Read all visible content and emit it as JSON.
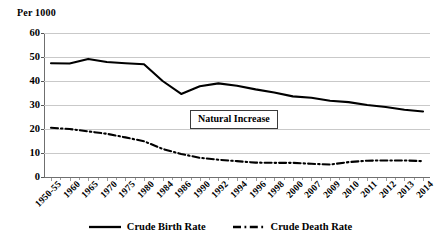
{
  "chart_data": {
    "type": "line",
    "title": "",
    "ylabel": "Per 1000",
    "xlabel": "",
    "ylim": [
      0,
      60
    ],
    "yticks": [
      0,
      10,
      20,
      30,
      40,
      50,
      60
    ],
    "grid": true,
    "legend_position": "bottom",
    "categories": [
      "1950-55",
      "1960",
      "1965",
      "1970",
      "1975",
      "1980",
      "1984",
      "1986",
      "1990",
      "1992",
      "1994",
      "1996",
      "1998",
      "2000",
      "2007",
      "2009",
      "2010",
      "2011",
      "2012",
      "2013",
      "2014"
    ],
    "series": [
      {
        "name": "Crude Birth Rate",
        "style": "solid",
        "color": "#000000",
        "values": [
          47.4,
          47.3,
          49.2,
          47.9,
          47.4,
          47.0,
          40.0,
          34.6,
          37.8,
          39.0,
          38.0,
          36.5,
          35.2,
          33.6,
          33.0,
          31.8,
          31.2,
          30.0,
          29.2,
          28.0,
          27.3
        ]
      },
      {
        "name": "Crude Death Rate",
        "style": "dash-dot",
        "color": "#000000",
        "values": [
          20.5,
          20.0,
          19.0,
          18.0,
          16.5,
          14.9,
          11.7,
          9.6,
          8.0,
          7.2,
          6.6,
          6.0,
          5.9,
          5.9,
          5.5,
          5.2,
          6.2,
          6.8,
          6.9,
          6.9,
          6.6
        ]
      }
    ],
    "annotations": [
      {
        "text": "Natural Increase",
        "x": 190,
        "y": 110,
        "boxed": true
      }
    ]
  },
  "legend": {
    "items": [
      {
        "label": "Crude Birth Rate",
        "style": "solid",
        "icon": "solid-line-icon"
      },
      {
        "label": "Crude Death Rate",
        "style": "dash-dot",
        "icon": "dash-dot-line-icon"
      }
    ]
  }
}
